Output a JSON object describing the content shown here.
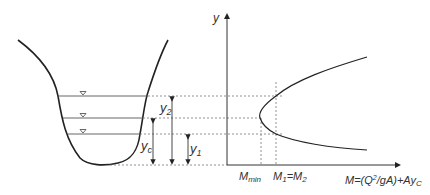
{
  "diagram": {
    "type": "specific-force-diagram",
    "channel_section": {
      "water_levels": [
        "y2",
        "yc",
        "y1"
      ],
      "depth_labels": {
        "y2": "y",
        "y2_sub": "2",
        "yc": "y",
        "yc_sub": "c",
        "y1": "y",
        "y1_sub": "1"
      }
    },
    "graph": {
      "y_axis_label": "y",
      "x_axis_label_prefix": "M=(Q",
      "x_axis_label_sup": "2",
      "x_axis_label_mid": "/gA)+Ay",
      "x_axis_label_sub": "C",
      "tick_mmin": "M",
      "tick_mmin_sub": "min",
      "tick_m1": "M",
      "tick_m1_sub": "1",
      "tick_eq": "=M",
      "tick_m2_sub": "2"
    },
    "colors": {
      "line": "#222222",
      "dashed": "#666666",
      "text": "#333333"
    }
  }
}
